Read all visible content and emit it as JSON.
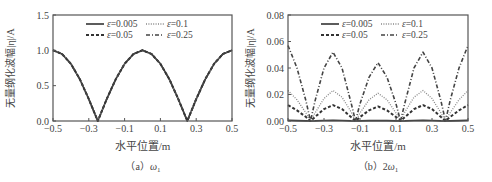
{
  "chart_data": [
    {
      "type": "line",
      "panel": "a",
      "caption": "（a）ω₁",
      "caption_main": "（a）",
      "caption_sym": "ω",
      "caption_sub": "1",
      "xlabel": "水平位置/m",
      "ylabel": "无量纲化波幅|η|/A",
      "xlim": [
        -0.5,
        0.5
      ],
      "ylim": [
        0,
        1.5
      ],
      "xticks": [
        -0.5,
        -0.3,
        -0.1,
        0.1,
        0.3,
        0.5
      ],
      "xtick_labels": [
        "−0.5",
        "−0.3",
        "−0.1",
        "0.1",
        "0.3",
        "0.5"
      ],
      "yticks": [
        0,
        0.5,
        1.0,
        1.5
      ],
      "ytick_labels": [
        "0.0",
        "0.5",
        "1.0",
        "1.5"
      ],
      "grid": false,
      "legend_position": "upper center, 2 columns",
      "x": [
        -0.5,
        -0.45,
        -0.4,
        -0.35,
        -0.3,
        -0.25,
        -0.2,
        -0.15,
        -0.1,
        -0.05,
        0.0,
        0.05,
        0.1,
        0.15,
        0.2,
        0.25,
        0.3,
        0.35,
        0.4,
        0.45,
        0.5
      ],
      "series": [
        {
          "name": "ε=0.005",
          "style": "solid",
          "values": [
            1.0,
            0.95,
            0.81,
            0.59,
            0.31,
            0.0,
            0.31,
            0.59,
            0.81,
            0.95,
            1.0,
            0.95,
            0.81,
            0.59,
            0.31,
            0.0,
            0.31,
            0.59,
            0.81,
            0.95,
            1.0
          ]
        },
        {
          "name": "ε=0.1",
          "style": "dotted",
          "values": [
            1.0,
            0.95,
            0.81,
            0.59,
            0.31,
            0.0,
            0.31,
            0.59,
            0.81,
            0.95,
            1.0,
            0.95,
            0.81,
            0.59,
            0.31,
            0.0,
            0.31,
            0.59,
            0.81,
            0.95,
            1.0
          ]
        },
        {
          "name": "ε=0.05",
          "style": "dashed",
          "values": [
            1.0,
            0.95,
            0.81,
            0.59,
            0.31,
            0.0,
            0.31,
            0.59,
            0.81,
            0.95,
            1.0,
            0.95,
            0.81,
            0.59,
            0.31,
            0.0,
            0.31,
            0.59,
            0.81,
            0.95,
            1.0
          ]
        },
        {
          "name": "ε=0.25",
          "style": "dashdot",
          "values": [
            1.0,
            0.95,
            0.81,
            0.59,
            0.31,
            0.0,
            0.31,
            0.59,
            0.81,
            0.95,
            1.0,
            0.95,
            0.81,
            0.59,
            0.31,
            0.0,
            0.31,
            0.59,
            0.81,
            0.95,
            1.0
          ]
        }
      ]
    },
    {
      "type": "line",
      "panel": "b",
      "caption": "（b）2ω₁",
      "caption_main": "（b）2",
      "caption_sym": "ω",
      "caption_sub": "1",
      "xlabel": "水平位置/m",
      "ylabel": "无量纲化波幅|η|/A",
      "xlim": [
        -0.5,
        0.5
      ],
      "ylim": [
        0,
        0.08
      ],
      "xticks": [
        -0.5,
        -0.3,
        -0.1,
        0.1,
        0.3,
        0.5
      ],
      "xtick_labels": [
        "−0.5",
        "−0.3",
        "−0.1",
        "0.1",
        "0.3",
        "0.5"
      ],
      "yticks": [
        0,
        0.02,
        0.04,
        0.06,
        0.08
      ],
      "ytick_labels": [
        "0.00",
        "0.02",
        "0.04",
        "0.06",
        "0.08"
      ],
      "grid": false,
      "legend_position": "upper center, 2 columns",
      "x": [
        -0.5,
        -0.45,
        -0.4,
        -0.375,
        -0.35,
        -0.3,
        -0.25,
        -0.2,
        -0.15,
        -0.125,
        -0.1,
        -0.05,
        0.0,
        0.05,
        0.1,
        0.125,
        0.15,
        0.2,
        0.25,
        0.3,
        0.35,
        0.375,
        0.4,
        0.45,
        0.5
      ],
      "series": [
        {
          "name": "ε=0.005",
          "style": "solid",
          "values": [
            0.0005,
            0.0003,
            0.0001,
            0.0,
            0.0001,
            0.0004,
            0.0005,
            0.0004,
            0.0001,
            0.0,
            0.0001,
            0.0003,
            0.0004,
            0.0003,
            0.0001,
            0.0,
            0.0001,
            0.0004,
            0.0005,
            0.0004,
            0.0001,
            0.0,
            0.0001,
            0.0003,
            0.0005
          ]
        },
        {
          "name": "ε=0.1",
          "style": "dotted",
          "values": [
            0.023,
            0.016,
            0.006,
            0.0,
            0.006,
            0.017,
            0.023,
            0.018,
            0.007,
            0.0,
            0.006,
            0.016,
            0.021,
            0.016,
            0.006,
            0.0,
            0.007,
            0.018,
            0.023,
            0.017,
            0.006,
            0.0,
            0.006,
            0.016,
            0.023
          ]
        },
        {
          "name": "ε=0.05",
          "style": "dashed",
          "values": [
            0.012,
            0.008,
            0.003,
            0.0,
            0.003,
            0.009,
            0.012,
            0.009,
            0.003,
            0.0,
            0.003,
            0.008,
            0.011,
            0.008,
            0.003,
            0.0,
            0.003,
            0.009,
            0.012,
            0.009,
            0.003,
            0.0,
            0.003,
            0.008,
            0.012
          ]
        },
        {
          "name": "ε=0.25",
          "style": "dashdot",
          "values": [
            0.057,
            0.04,
            0.015,
            0.0,
            0.015,
            0.04,
            0.052,
            0.04,
            0.014,
            0.0,
            0.013,
            0.033,
            0.044,
            0.033,
            0.013,
            0.0,
            0.014,
            0.04,
            0.052,
            0.04,
            0.015,
            0.0,
            0.015,
            0.04,
            0.057
          ]
        }
      ]
    }
  ]
}
